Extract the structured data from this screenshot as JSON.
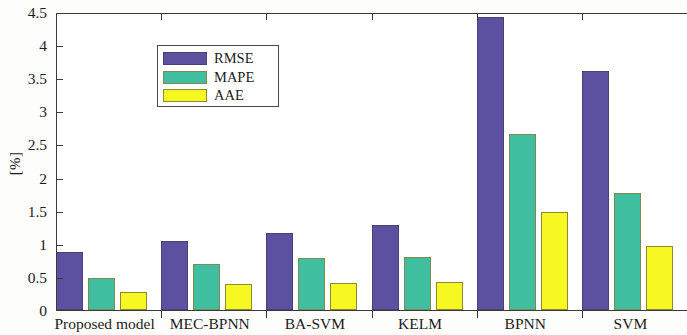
{
  "chart_data": {
    "type": "bar",
    "title": "",
    "xlabel": "",
    "ylabel": "[%]",
    "ylim": [
      0,
      4.5
    ],
    "yticks": [
      0,
      0.5,
      1,
      1.5,
      2,
      2.5,
      3,
      3.5,
      4,
      4.5
    ],
    "ytick_labels": [
      "0",
      "0.5",
      "1",
      "1.5",
      "2",
      "2.5",
      "3",
      "3.5",
      "4",
      "4.5"
    ],
    "grid": false,
    "legend_position": "upper left",
    "categories": [
      "Proposed model",
      "MEC-BPNN",
      "BA-SVM",
      "KELM",
      "BPNN",
      "SVM"
    ],
    "series": [
      {
        "name": "RMSE",
        "color": "#5b51a0",
        "values": [
          0.87,
          1.04,
          1.16,
          1.29,
          4.42,
          3.61
        ]
      },
      {
        "name": "MAPE",
        "color": "#3fbfa0",
        "values": [
          0.49,
          0.69,
          0.79,
          0.8,
          2.66,
          1.76
        ]
      },
      {
        "name": "AAE",
        "color": "#f7f721",
        "values": [
          0.27,
          0.39,
          0.41,
          0.43,
          1.48,
          0.97
        ]
      }
    ]
  },
  "axes": {
    "y_title": "[%]"
  }
}
